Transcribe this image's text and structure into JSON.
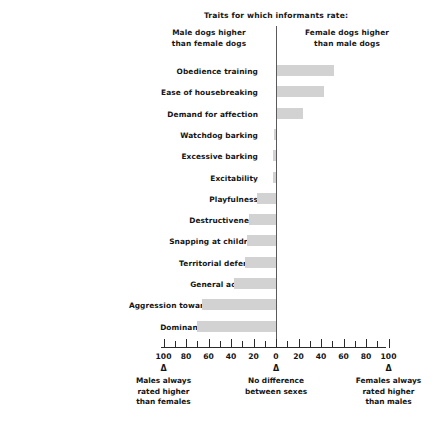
{
  "header": {
    "title": "Traits for which informants rate:",
    "left_caption": "Male dogs higher\nthan female dogs",
    "left_caption_line1": "Male dogs higher",
    "left_caption_line2": "than female dogs",
    "right_caption_line1": "Female dogs higher",
    "right_caption_line2": "than male dogs"
  },
  "footer": {
    "markers": [
      {
        "symbol": "Δ",
        "value": -100,
        "line1": "Males always",
        "line2": "rated higher",
        "line3": "than females"
      },
      {
        "symbol": "Δ",
        "value": 0,
        "line1": "No difference",
        "line2": "between sexes",
        "line3": ""
      },
      {
        "symbol": "Δ",
        "value": 100,
        "line1": "Females always",
        "line2": "rated higher",
        "line3": "than males"
      }
    ]
  },
  "chart_data": {
    "type": "bar",
    "orientation": "horizontal",
    "title": "Traits for which informants rate:",
    "subtitle_left": "Male dogs higher than female dogs",
    "subtitle_right": "Female dogs higher than male dogs",
    "xlabel": "",
    "ylabel": "",
    "xlim": [
      -100,
      100
    ],
    "xticks": [
      -100,
      -80,
      -60,
      -40,
      -20,
      0,
      20,
      40,
      60,
      80,
      100
    ],
    "xticklabels": [
      "100",
      "80",
      "60",
      "40",
      "20",
      "0",
      "20",
      "40",
      "60",
      "80",
      "100"
    ],
    "xminorticks": [
      -90,
      -70,
      -50,
      -30,
      -10,
      10,
      30,
      50,
      70,
      90
    ],
    "grid": false,
    "legend": false,
    "bar_color": "#d2d2d2",
    "axis_color": "#5a5a5a",
    "note": "Negative values = males rated higher; positive values = females rated higher",
    "categories": [
      "Obedience training",
      "Ease of housebreaking",
      "Demand for affection",
      "Watchdog barking",
      "Excessive barking",
      "Excitability",
      "Playfulness",
      "Destructiveness",
      "Snapping at children",
      "Territorial defense",
      "General activity",
      "Aggression toward other dogs",
      "Dominance over owner"
    ],
    "values": [
      51,
      42,
      23,
      -2,
      -3,
      -3,
      -17,
      -24,
      -26,
      -28,
      -37,
      -66,
      -70
    ]
  }
}
